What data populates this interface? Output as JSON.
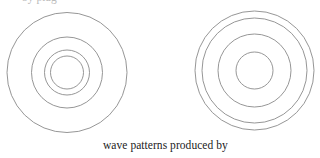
{
  "figure": {
    "stroke_color": "#8a8a8a",
    "stroke_width": 0.9,
    "top_cutoff_text": "by plug",
    "panels": [
      {
        "name": "left-wave-pattern",
        "center": {
          "x": 67,
          "y": 72.5
        },
        "radii": [
          60,
          35.5,
          22.5,
          16.5
        ]
      },
      {
        "name": "right-wave-pattern",
        "center": {
          "x": 254.5,
          "y": 70.5
        },
        "radii": [
          59.5,
          52.5,
          36.5,
          18.5
        ]
      }
    ],
    "caption": "wave patterns produced by"
  }
}
